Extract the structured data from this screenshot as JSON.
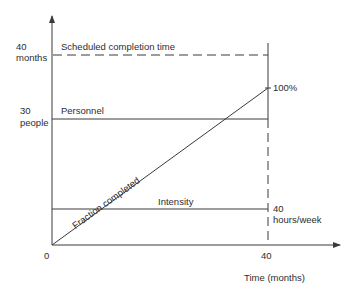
{
  "diagram": {
    "type": "project-tradeoff-line-diagram",
    "colors": {
      "line": "#3a3a3a",
      "text": "#2e2e2e",
      "background": "#ffffff"
    },
    "y_axis_labels": {
      "months_value": "40",
      "months_unit": "months",
      "people_value": "30",
      "people_unit": "people"
    },
    "lines": {
      "scheduled": "Scheduled completion time",
      "personnel": "Personnel",
      "intensity": "Intensity",
      "fraction": "Fraction completed"
    },
    "right_labels": {
      "percent": "100%",
      "hours_value": "40",
      "hours_unit": "hours/week"
    },
    "x_axis": {
      "origin": "0",
      "tick": "40",
      "title": "Time (months)"
    }
  }
}
